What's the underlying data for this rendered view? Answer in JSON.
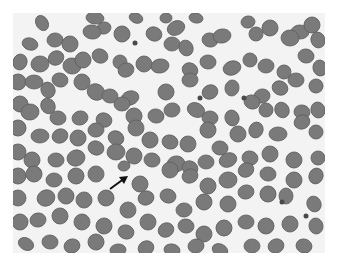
{
  "image": {
    "type": "blood-smear-micrograph",
    "background_color": "#f3f3f3",
    "cell_color": "#7a7a7a",
    "cell_edge_color": "#5e5e5e",
    "annotation": {
      "type": "arrow",
      "color": "#111111",
      "x1": 110,
      "y1": 189,
      "x2": 128,
      "y2": 176
    }
  },
  "cells": [
    [
      42,
      23,
      6,
      8
    ],
    [
      95,
      18,
      9,
      6
    ],
    [
      104,
      28,
      7,
      6
    ],
    [
      136,
      18,
      7,
      5
    ],
    [
      166,
      18,
      6,
      5
    ],
    [
      176,
      28,
      9,
      7
    ],
    [
      196,
      18,
      7,
      5
    ],
    [
      248,
      22,
      7,
      6
    ],
    [
      270,
      28,
      8,
      8
    ],
    [
      300,
      32,
      9,
      7
    ],
    [
      312,
      25,
      8,
      8
    ],
    [
      30,
      44,
      8,
      6
    ],
    [
      55,
      40,
      8,
      7
    ],
    [
      70,
      44,
      8,
      8
    ],
    [
      92,
      32,
      9,
      7
    ],
    [
      122,
      34,
      8,
      8
    ],
    [
      154,
      34,
      8,
      7
    ],
    [
      172,
      44,
      8,
      7
    ],
    [
      186,
      48,
      7,
      8
    ],
    [
      210,
      40,
      8,
      7
    ],
    [
      222,
      36,
      9,
      7
    ],
    [
      256,
      34,
      7,
      7
    ],
    [
      290,
      38,
      9,
      8
    ],
    [
      318,
      40,
      7,
      8
    ],
    [
      20,
      62,
      7,
      8
    ],
    [
      40,
      64,
      9,
      8
    ],
    [
      56,
      58,
      8,
      7
    ],
    [
      72,
      66,
      9,
      8
    ],
    [
      83,
      60,
      8,
      8
    ],
    [
      100,
      56,
      8,
      7
    ],
    [
      120,
      62,
      7,
      7
    ],
    [
      126,
      70,
      8,
      7
    ],
    [
      144,
      64,
      8,
      8
    ],
    [
      160,
      66,
      9,
      7
    ],
    [
      190,
      70,
      8,
      7
    ],
    [
      208,
      62,
      8,
      7
    ],
    [
      232,
      68,
      9,
      7
    ],
    [
      250,
      60,
      7,
      7
    ],
    [
      266,
      66,
      8,
      7
    ],
    [
      284,
      72,
      7,
      7
    ],
    [
      306,
      56,
      8,
      7
    ],
    [
      320,
      68,
      7,
      8
    ],
    [
      18,
      82,
      8,
      8
    ],
    [
      34,
      82,
      9,
      7
    ],
    [
      48,
      90,
      7,
      8
    ],
    [
      60,
      80,
      8,
      7
    ],
    [
      82,
      82,
      8,
      8
    ],
    [
      96,
      92,
      9,
      8
    ],
    [
      110,
      96,
      8,
      7
    ],
    [
      130,
      98,
      9,
      7
    ],
    [
      166,
      92,
      8,
      8
    ],
    [
      190,
      80,
      8,
      7
    ],
    [
      210,
      92,
      8,
      7
    ],
    [
      232,
      88,
      7,
      8
    ],
    [
      262,
      96,
      8,
      7
    ],
    [
      280,
      88,
      8,
      7
    ],
    [
      296,
      80,
      8,
      7
    ],
    [
      316,
      86,
      7,
      7
    ],
    [
      20,
      104,
      8,
      8
    ],
    [
      30,
      112,
      9,
      8
    ],
    [
      48,
      106,
      7,
      8
    ],
    [
      58,
      118,
      8,
      7
    ],
    [
      80,
      118,
      8,
      7
    ],
    [
      104,
      120,
      8,
      7
    ],
    [
      122,
      104,
      8,
      7
    ],
    [
      134,
      116,
      8,
      8
    ],
    [
      156,
      116,
      8,
      7
    ],
    [
      172,
      110,
      8,
      7
    ],
    [
      196,
      110,
      9,
      7
    ],
    [
      210,
      118,
      8,
      7
    ],
    [
      232,
      118,
      7,
      8
    ],
    [
      252,
      102,
      8,
      7
    ],
    [
      266,
      110,
      7,
      7
    ],
    [
      282,
      110,
      7,
      8
    ],
    [
      302,
      112,
      8,
      7
    ],
    [
      318,
      110,
      7,
      8
    ],
    [
      18,
      128,
      8,
      8
    ],
    [
      40,
      136,
      9,
      7
    ],
    [
      60,
      136,
      8,
      7
    ],
    [
      78,
      138,
      8,
      8
    ],
    [
      96,
      130,
      8,
      7
    ],
    [
      116,
      138,
      8,
      7
    ],
    [
      136,
      128,
      8,
      8
    ],
    [
      150,
      140,
      8,
      8
    ],
    [
      170,
      142,
      8,
      7
    ],
    [
      188,
      144,
      8,
      8
    ],
    [
      208,
      130,
      8,
      8
    ],
    [
      220,
      148,
      8,
      7
    ],
    [
      238,
      134,
      8,
      8
    ],
    [
      256,
      130,
      7,
      8
    ],
    [
      278,
      134,
      9,
      7
    ],
    [
      302,
      122,
      8,
      7
    ],
    [
      316,
      132,
      7,
      7
    ],
    [
      18,
      152,
      8,
      8
    ],
    [
      32,
      160,
      8,
      8
    ],
    [
      56,
      160,
      8,
      7
    ],
    [
      76,
      158,
      9,
      8
    ],
    [
      96,
      148,
      8,
      7
    ],
    [
      116,
      152,
      9,
      8
    ],
    [
      134,
      156,
      8,
      8
    ],
    [
      152,
      160,
      8,
      7
    ],
    [
      176,
      164,
      9,
      8
    ],
    [
      190,
      168,
      8,
      7
    ],
    [
      206,
      162,
      8,
      7
    ],
    [
      228,
      160,
      9,
      7
    ],
    [
      250,
      158,
      8,
      7
    ],
    [
      270,
      154,
      8,
      8
    ],
    [
      294,
      160,
      8,
      8
    ],
    [
      318,
      158,
      7,
      7
    ],
    [
      18,
      176,
      8,
      8
    ],
    [
      34,
      174,
      8,
      8
    ],
    [
      54,
      180,
      8,
      7
    ],
    [
      76,
      176,
      8,
      8
    ],
    [
      96,
      174,
      8,
      8
    ],
    [
      124,
      166,
      6,
      5
    ],
    [
      140,
      184,
      8,
      8
    ],
    [
      170,
      170,
      8,
      8
    ],
    [
      190,
      176,
      8,
      7
    ],
    [
      208,
      186,
      8,
      8
    ],
    [
      228,
      180,
      9,
      8
    ],
    [
      246,
      170,
      8,
      7
    ],
    [
      268,
      174,
      8,
      7
    ],
    [
      294,
      180,
      8,
      8
    ],
    [
      316,
      176,
      7,
      8
    ],
    [
      18,
      198,
      8,
      8
    ],
    [
      46,
      198,
      9,
      8
    ],
    [
      66,
      196,
      8,
      8
    ],
    [
      84,
      200,
      8,
      8
    ],
    [
      106,
      198,
      8,
      8
    ],
    [
      128,
      210,
      8,
      8
    ],
    [
      146,
      198,
      8,
      7
    ],
    [
      168,
      196,
      8,
      7
    ],
    [
      184,
      210,
      8,
      7
    ],
    [
      204,
      202,
      8,
      8
    ],
    [
      228,
      204,
      8,
      8
    ],
    [
      246,
      192,
      8,
      7
    ],
    [
      268,
      194,
      8,
      8
    ],
    [
      286,
      196,
      7,
      8
    ],
    [
      314,
      204,
      7,
      8
    ],
    [
      20,
      222,
      8,
      8
    ],
    [
      38,
      220,
      8,
      7
    ],
    [
      60,
      216,
      8,
      8
    ],
    [
      82,
      222,
      8,
      8
    ],
    [
      104,
      226,
      8,
      8
    ],
    [
      126,
      232,
      8,
      7
    ],
    [
      148,
      222,
      8,
      8
    ],
    [
      166,
      230,
      8,
      7
    ],
    [
      186,
      226,
      8,
      7
    ],
    [
      204,
      234,
      8,
      8
    ],
    [
      224,
      228,
      8,
      8
    ],
    [
      246,
      222,
      8,
      7
    ],
    [
      266,
      226,
      8,
      8
    ],
    [
      290,
      224,
      8,
      8
    ],
    [
      316,
      226,
      7,
      8
    ],
    [
      26,
      244,
      8,
      6
    ],
    [
      50,
      242,
      8,
      7
    ],
    [
      72,
      246,
      8,
      7
    ],
    [
      96,
      242,
      8,
      8
    ],
    [
      118,
      250,
      8,
      6
    ],
    [
      146,
      248,
      8,
      7
    ],
    [
      172,
      250,
      8,
      6
    ],
    [
      196,
      246,
      8,
      7
    ],
    [
      220,
      250,
      8,
      6
    ],
    [
      252,
      246,
      8,
      7
    ],
    [
      276,
      246,
      8,
      7
    ],
    [
      304,
      246,
      8,
      7
    ]
  ],
  "platelets": [
    [
      135,
      43
    ],
    [
      200,
      98
    ],
    [
      244,
      98
    ],
    [
      282,
      202
    ],
    [
      306,
      216
    ]
  ]
}
